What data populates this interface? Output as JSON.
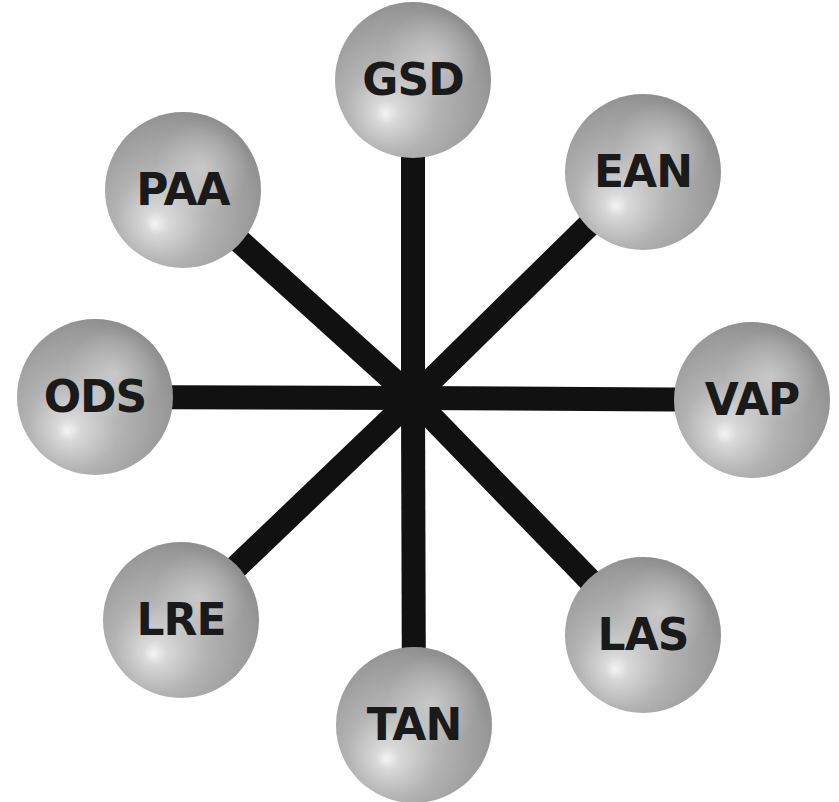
{
  "diagram": {
    "type": "hub-and-spoke",
    "hub": {
      "x": 413,
      "y": 398
    },
    "spoke_color": "#111111",
    "spoke_width": 24,
    "node_radius": 78,
    "nodes": [
      {
        "label": "GSD",
        "x": 413,
        "y": 80
      },
      {
        "label": "EAN",
        "x": 643,
        "y": 172
      },
      {
        "label": "VAP",
        "x": 752,
        "y": 400
      },
      {
        "label": "LAS",
        "x": 643,
        "y": 635
      },
      {
        "label": "TAN",
        "x": 414,
        "y": 725
      },
      {
        "label": "LRE",
        "x": 181,
        "y": 620
      },
      {
        "label": "ODS",
        "x": 95,
        "y": 397
      },
      {
        "label": "PAA",
        "x": 183,
        "y": 190
      }
    ]
  }
}
